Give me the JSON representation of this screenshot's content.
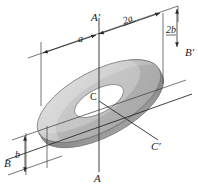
{
  "figure": {
    "shape_name": "annulus-disk",
    "labels": {
      "axis_a_top": "A′",
      "axis_a_bottom": "A",
      "axis_b_right": "B′",
      "axis_b_left": "B",
      "axis_c_right": "C′",
      "center": "C",
      "dim_inner_radius": "a",
      "dim_outer_diameter": "2a",
      "dim_inner_half_height": "b",
      "dim_outer_height": "2b"
    },
    "colors": {
      "ring_face": "#b9b9b9",
      "ring_face_light": "#d2d2d2",
      "ring_edge_dark": "#8f8f8f",
      "hole": "#ffffff",
      "stroke": "#3b3b3b",
      "background": "#ffffff"
    },
    "geometry": {
      "center_x": 99,
      "center_y": 101,
      "outer_rx": 68,
      "outer_ry": 30,
      "inner_rx": 27,
      "inner_ry": 12,
      "tilt_deg": -28,
      "thickness_px": 6
    }
  }
}
